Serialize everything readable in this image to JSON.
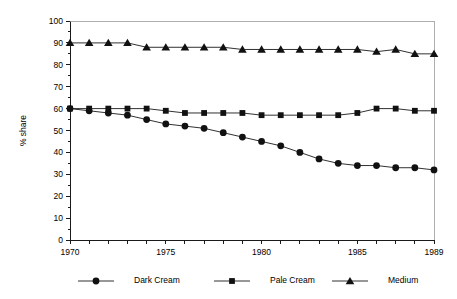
{
  "chart_data": {
    "type": "line",
    "title": "",
    "xlabel": "",
    "ylabel": "% share",
    "xlim": [
      1970,
      1989
    ],
    "ylim": [
      0,
      100
    ],
    "grid": false,
    "legend_position": "bottom",
    "x": [
      1970,
      1971,
      1972,
      1973,
      1974,
      1975,
      1976,
      1977,
      1978,
      1979,
      1980,
      1981,
      1982,
      1983,
      1984,
      1985,
      1986,
      1987,
      1988,
      1989
    ],
    "x_tick_labels": [
      "1970",
      "1975",
      "1980",
      "1985",
      "1989"
    ],
    "x_tick_values": [
      1970,
      1975,
      1980,
      1985,
      1989
    ],
    "y_tick_labels": [
      "0",
      "10",
      "20",
      "30",
      "40",
      "50",
      "60",
      "70",
      "80",
      "90",
      "100"
    ],
    "y_tick_values": [
      0,
      10,
      20,
      30,
      40,
      50,
      60,
      70,
      80,
      90,
      100
    ],
    "series": [
      {
        "name": "Dark Cream",
        "marker": "circle",
        "values": [
          60,
          59,
          58,
          57,
          55,
          53,
          52,
          51,
          49,
          47,
          45,
          43,
          40,
          37,
          35,
          34,
          34,
          33,
          33,
          32
        ]
      },
      {
        "name": "Pale Cream",
        "marker": "square",
        "values": [
          60,
          60,
          60,
          60,
          60,
          59,
          58,
          58,
          58,
          58,
          57,
          57,
          57,
          57,
          57,
          58,
          60,
          60,
          59,
          59
        ]
      },
      {
        "name": "Medium",
        "marker": "triangle",
        "values": [
          90,
          90,
          90,
          90,
          88,
          88,
          88,
          88,
          88,
          87,
          87,
          87,
          87,
          87,
          87,
          87,
          86,
          87,
          85,
          85
        ]
      }
    ]
  },
  "legend": {
    "items": [
      {
        "label": "Dark Cream",
        "marker": "circle"
      },
      {
        "label": "Pale Cream",
        "marker": "square"
      },
      {
        "label": "Medium",
        "marker": "triangle"
      }
    ]
  },
  "colors": {
    "ink": "#1a1a1a",
    "marker": "#111111",
    "background": "#ffffff"
  }
}
